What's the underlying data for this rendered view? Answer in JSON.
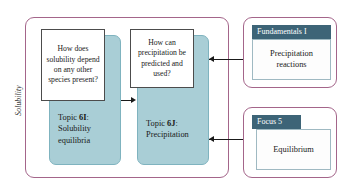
{
  "diagram": {
    "axis_label": "Solubility",
    "topics": [
      {
        "id": "topic-6i",
        "question": "How does solubility depend on any other species present?",
        "label_prefix": "Topic ",
        "label_code": "6I",
        "label_suffix": ":",
        "title": "Solubility equilibria"
      },
      {
        "id": "topic-6j",
        "question": "How can precipitation be predicted and used?",
        "label_prefix": "Topic ",
        "label_code": "6J",
        "label_suffix": ":",
        "title": "Precipitation"
      }
    ],
    "side_panels": [
      {
        "id": "fundamentals-i",
        "header": "Fundamentals I",
        "body": "Precipitation reactions"
      },
      {
        "id": "focus-5",
        "header": "Focus 5",
        "body": "Equilibrium"
      }
    ],
    "colors": {
      "container_border": "#a4658a",
      "topic_fill": "#a9ced6",
      "topic_border": "#7fb3bf",
      "panel_header_bg": "#3d6477",
      "panel_header_text": "#ffffff",
      "question_border": "#4c4c4c",
      "connector": "#1a1a1a",
      "background": "#ffffff"
    }
  }
}
